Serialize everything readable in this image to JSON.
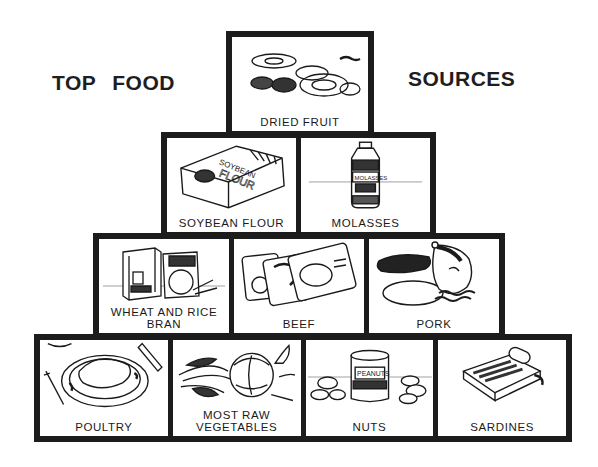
{
  "title": {
    "left": "TOP FOOD",
    "right": "SOURCES"
  },
  "pyramid": {
    "rows": [
      {
        "items": [
          {
            "label": "DRIED FRUIT",
            "icon": "dried-fruit-illustration"
          }
        ]
      },
      {
        "items": [
          {
            "label": "SOYBEAN FLOUR",
            "icon": "soybean-flour-bag-illustration"
          },
          {
            "label": "MOLASSES",
            "icon": "molasses-bottle-illustration"
          }
        ]
      },
      {
        "items": [
          {
            "label": "WHEAT AND RICE BRAN",
            "icon": "bran-boxes-illustration"
          },
          {
            "label": "BEEF",
            "icon": "beef-packages-illustration"
          },
          {
            "label": "PORK",
            "icon": "pork-ham-illustration"
          }
        ]
      },
      {
        "items": [
          {
            "label": "POULTRY",
            "icon": "roast-chicken-plate-illustration"
          },
          {
            "label": "MOST RAW VEGETABLES",
            "icon": "vegetables-illustration"
          },
          {
            "label": "NUTS",
            "icon": "peanut-can-illustration"
          },
          {
            "label": "SARDINES",
            "icon": "sardine-tin-illustration"
          }
        ]
      }
    ]
  },
  "colors": {
    "frame": "#1c1c1c",
    "background": "#ffffff",
    "text": "#1a1a1a"
  }
}
